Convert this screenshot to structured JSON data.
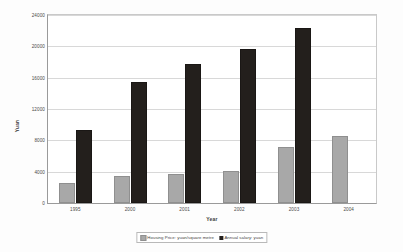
{
  "chart_data": {
    "type": "bar",
    "title": "",
    "xlabel": "Year",
    "ylabel": "Yuan",
    "categories": [
      "1995",
      "2000",
      "2001",
      "2002",
      "2003",
      "2004"
    ],
    "series": [
      {
        "name": "Housing Price: yuan/square metre",
        "color": "#a8a8a8",
        "values": [
          2500,
          3400,
          3700,
          4100,
          7100,
          8600
        ]
      },
      {
        "name": "Annual salary: yuan",
        "color": "#231f1c",
        "values": [
          9300,
          15500,
          17800,
          19600,
          22300,
          null
        ]
      }
    ],
    "ylim": [
      0,
      24000
    ],
    "yticks": [
      0,
      4000,
      8000,
      12000,
      16000,
      20000,
      24000
    ],
    "ytick_labels": [
      "0",
      "4000",
      "8000",
      "12000",
      "16000",
      "20000",
      "24000"
    ],
    "grid": true,
    "legend_position": "bottom"
  }
}
